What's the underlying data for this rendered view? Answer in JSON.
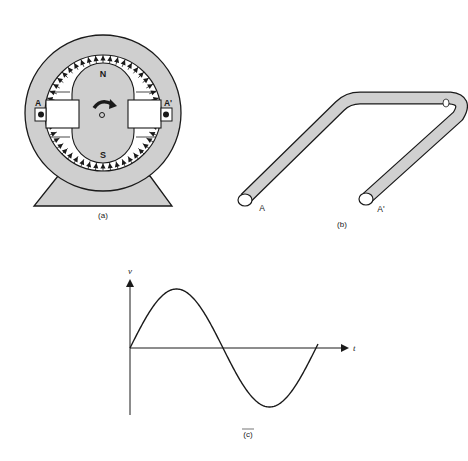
{
  "panels": {
    "a": {
      "caption": "(a)",
      "pole_north": "N",
      "pole_south": "S",
      "terminal_left": "A",
      "terminal_right": "A'",
      "shaft_label": "O",
      "colors": {
        "fill": "#cfcfcf",
        "stroke": "#1a1a1a",
        "slot": "#ffffff"
      }
    },
    "b": {
      "caption": "(b)",
      "end_left": "A",
      "end_right": "A'",
      "colors": {
        "fill": "#d0d0d0",
        "stroke": "#1a1a1a"
      }
    },
    "c": {
      "caption": "(c)",
      "y_axis_label": "v",
      "x_axis_label": "t",
      "curve": "sine"
    }
  },
  "chart_data": {
    "type": "line",
    "title": "",
    "xlabel": "t",
    "ylabel": "v",
    "x": [
      0,
      0.25,
      0.5,
      0.75,
      1.0
    ],
    "values": [
      0,
      1,
      0,
      -1,
      0.1
    ],
    "grid": false
  }
}
